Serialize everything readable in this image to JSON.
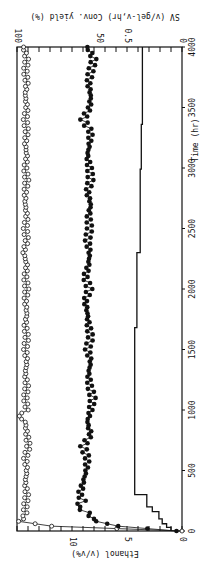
{
  "chart_data": {
    "type": "line",
    "orientation_note": "figure rotated 90 degrees clockwise",
    "title": "",
    "xlabel": "Time (hr)",
    "xlim": [
      0,
      4000
    ],
    "x_ticks": [
      0,
      500,
      1000,
      1500,
      2000,
      2500,
      3000,
      3500,
      4000
    ],
    "axes": {
      "left": {
        "label": "Ethanol (v/v%)",
        "range": [
          0,
          15
        ],
        "ticks": [
          0,
          5,
          10
        ]
      },
      "right_outer": {
        "label": "Conv. yield (%)",
        "range": [
          0,
          100
        ],
        "ticks": [
          0,
          50,
          100
        ]
      },
      "right_inner": {
        "label": "SV (v/gel-v,hr)",
        "range": [
          0,
          1.5
        ],
        "ticks": [
          0,
          0.5
        ]
      }
    },
    "series": [
      {
        "name": "Conv. yield (%)",
        "marker": "open-circle",
        "axis": "right_outer",
        "x": [
          0,
          40,
          80,
          100,
          150,
          200,
          300,
          400,
          500,
          600,
          700,
          800,
          900,
          950,
          1000,
          1100,
          1200,
          1300,
          1400,
          1500,
          1600,
          1700,
          1800,
          1900,
          2000,
          2100,
          2200,
          2300,
          2400,
          2500,
          2600,
          2700,
          2800,
          2900,
          3000,
          3100,
          3200,
          3300,
          3400,
          3500,
          3600,
          3700,
          3800,
          3900,
          4000
        ],
        "values": [
          0,
          79,
          99,
          96,
          95,
          95,
          94,
          95,
          94,
          95,
          93,
          94,
          95,
          99,
          94,
          95,
          94,
          95,
          94,
          95,
          94,
          95,
          94,
          95,
          94,
          95,
          94,
          96,
          94,
          95,
          94,
          95,
          95,
          94,
          95,
          94,
          95,
          94,
          95,
          94,
          95,
          94,
          95,
          94,
          96
        ]
      },
      {
        "name": "Ethanol (v/v%)",
        "marker": "filled-circle",
        "axis": "left",
        "x": [
          0,
          40,
          80,
          100,
          150,
          200,
          250,
          300,
          400,
          500,
          600,
          700,
          800,
          900,
          1000,
          1100,
          1200,
          1300,
          1400,
          1500,
          1600,
          1700,
          1800,
          1900,
          2000,
          2100,
          2200,
          2300,
          2400,
          2500,
          2600,
          2700,
          2800,
          2900,
          3000,
          3100,
          3200,
          3300,
          3400,
          3500,
          3600,
          3700,
          3800,
          3900,
          4000
        ],
        "values": [
          0.5,
          5.8,
          7.8,
          8.0,
          8.6,
          9.5,
          9.0,
          9.3,
          9.0,
          8.7,
          8.6,
          9.0,
          8.3,
          8.6,
          8.3,
          8.1,
          8.4,
          8.5,
          8.3,
          8.6,
          8.3,
          8.5,
          8.6,
          8.8,
          8.4,
          8.8,
          8.5,
          8.4,
          8.6,
          8.4,
          8.5,
          8.3,
          8.6,
          8.3,
          8.4,
          8.6,
          8.4,
          8.3,
          9.0,
          8.4,
          8.3,
          8.5,
          8.3,
          8.0,
          8.6
        ]
      },
      {
        "name": "SV (v/gel-v,hr)",
        "marker": "none",
        "style": "step",
        "axis": "right_inner",
        "x": [
          0,
          30,
          60,
          100,
          160,
          200,
          300,
          1680,
          2300,
          2990,
          3360,
          4000
        ],
        "values": [
          0.1,
          0.14,
          0.18,
          0.21,
          0.27,
          0.32,
          0.43,
          0.41,
          0.38,
          0.37,
          0.36,
          0.36
        ]
      }
    ],
    "legend": null,
    "grid": false
  }
}
